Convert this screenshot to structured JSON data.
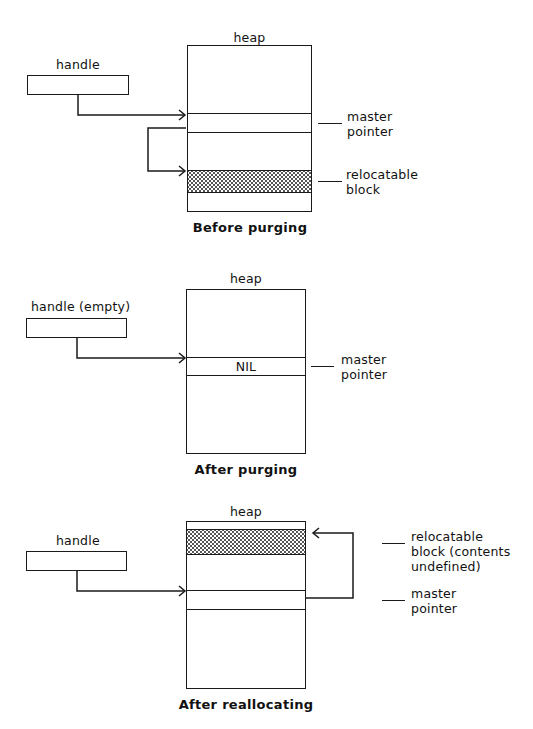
{
  "diagrams": [
    {
      "caption": "Before purging",
      "heap_label": "heap",
      "handle_label": "handle",
      "labels": {
        "master_pointer": [
          "master",
          "pointer"
        ],
        "relocatable_block": [
          "relocatable",
          "block"
        ]
      }
    },
    {
      "caption": "After purging",
      "heap_label": "heap",
      "handle_label": "handle (empty)",
      "nil_text": "NIL",
      "labels": {
        "master_pointer": [
          "master",
          "pointer"
        ]
      }
    },
    {
      "caption": "After reallocating",
      "heap_label": "heap",
      "handle_label": "handle",
      "labels": {
        "relocatable_block": [
          "relocatable",
          "block (contents",
          "undefined)"
        ],
        "master_pointer": [
          "master",
          "pointer"
        ]
      }
    }
  ],
  "colors": {
    "line": "#1a1a1a",
    "fill_pattern": "#555555",
    "background": "#ffffff"
  }
}
